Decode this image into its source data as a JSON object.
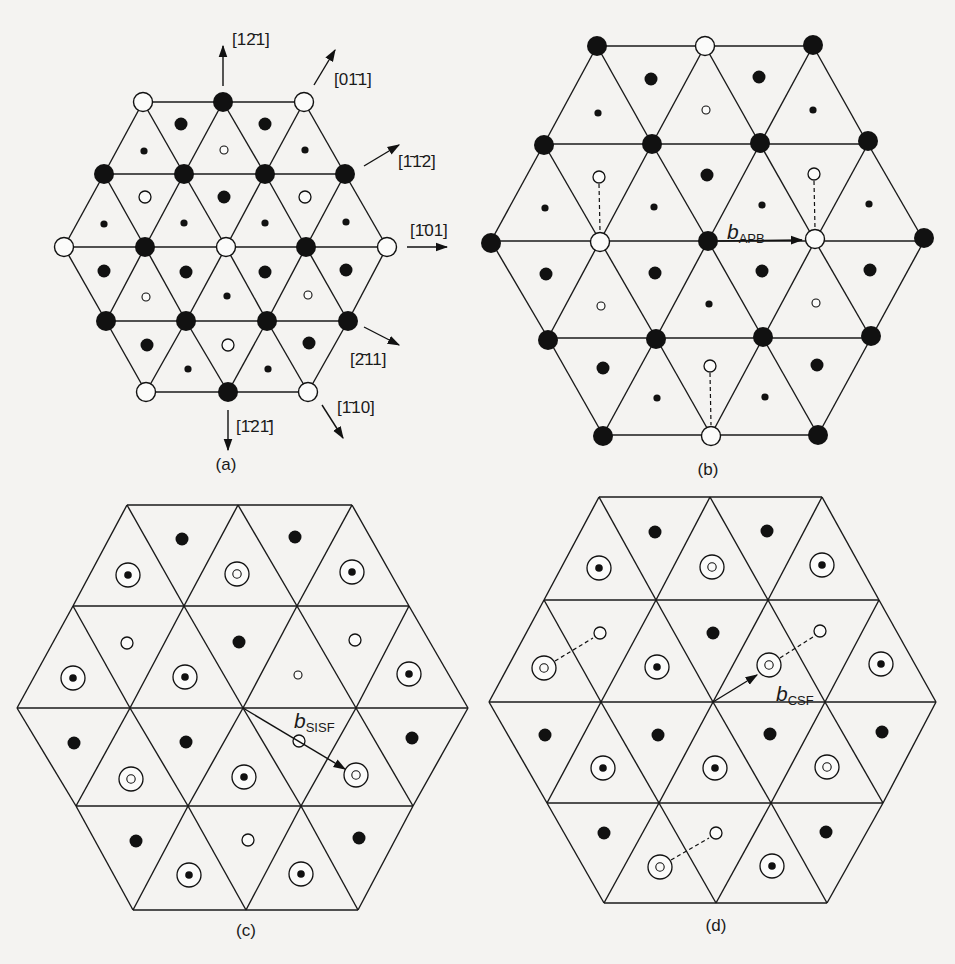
{
  "figure": {
    "legend_glyphs": {
      "lg_filled": "large filled circle (atom in layer A, type 1)",
      "lg_open": "large open circle (atom in layer A, type 2)",
      "md_filled": "medium filled circle (layer B, type 1)",
      "md_open": "medium open circle (layer B, type 2)",
      "sm_filled": "small filled circle (layer C, type 1)",
      "sm_open": "small open circle (layer C, type 2)",
      "target_dot": "ring with filled dot (superposed positions)",
      "target_ring": "ring with open dot (superposed positions)"
    },
    "colors": {
      "ink": "#111111",
      "paper": "#f4f3f1"
    }
  },
  "panels": {
    "a": {
      "caption": "(a)",
      "caption_pos": [
        226,
        470
      ],
      "triangle_rows": [
        {
          "y": 102,
          "x": [
            143,
            223,
            304
          ]
        },
        {
          "y": 174,
          "x": [
            104,
            184,
            265,
            345
          ]
        },
        {
          "y": 247,
          "x": [
            64,
            145,
            226,
            306,
            387
          ]
        },
        {
          "y": 321,
          "x": [
            106,
            186,
            267,
            348
          ]
        },
        {
          "y": 392,
          "x": [
            146,
            228,
            308
          ]
        }
      ],
      "atoms": [
        {
          "x": 143,
          "y": 102,
          "k": "lg_open"
        },
        {
          "x": 223,
          "y": 102,
          "k": "lg_filled"
        },
        {
          "x": 304,
          "y": 102,
          "k": "lg_open"
        },
        {
          "x": 104,
          "y": 174,
          "k": "lg_filled"
        },
        {
          "x": 184,
          "y": 174,
          "k": "lg_filled"
        },
        {
          "x": 265,
          "y": 174,
          "k": "lg_filled"
        },
        {
          "x": 345,
          "y": 174,
          "k": "lg_filled"
        },
        {
          "x": 64,
          "y": 247,
          "k": "lg_open"
        },
        {
          "x": 145,
          "y": 247,
          "k": "lg_filled"
        },
        {
          "x": 226,
          "y": 247,
          "k": "lg_open"
        },
        {
          "x": 306,
          "y": 247,
          "k": "lg_filled"
        },
        {
          "x": 387,
          "y": 247,
          "k": "lg_open"
        },
        {
          "x": 106,
          "y": 321,
          "k": "lg_filled"
        },
        {
          "x": 186,
          "y": 321,
          "k": "lg_filled"
        },
        {
          "x": 267,
          "y": 321,
          "k": "lg_filled"
        },
        {
          "x": 348,
          "y": 321,
          "k": "lg_filled"
        },
        {
          "x": 146,
          "y": 392,
          "k": "lg_open"
        },
        {
          "x": 228,
          "y": 392,
          "k": "lg_filled"
        },
        {
          "x": 308,
          "y": 392,
          "k": "lg_open"
        },
        {
          "x": 181,
          "y": 124,
          "k": "md_filled"
        },
        {
          "x": 265,
          "y": 124,
          "k": "md_filled"
        },
        {
          "x": 144,
          "y": 151,
          "k": "sm_filled"
        },
        {
          "x": 224,
          "y": 150,
          "k": "sm_open"
        },
        {
          "x": 305,
          "y": 150,
          "k": "sm_filled"
        },
        {
          "x": 145,
          "y": 197,
          "k": "md_open"
        },
        {
          "x": 224,
          "y": 197,
          "k": "md_filled"
        },
        {
          "x": 305,
          "y": 197,
          "k": "md_open"
        },
        {
          "x": 104,
          "y": 224,
          "k": "sm_filled"
        },
        {
          "x": 184,
          "y": 223,
          "k": "sm_filled"
        },
        {
          "x": 265,
          "y": 223,
          "k": "sm_filled"
        },
        {
          "x": 346,
          "y": 222,
          "k": "sm_filled"
        },
        {
          "x": 104,
          "y": 271,
          "k": "md_filled"
        },
        {
          "x": 186,
          "y": 272,
          "k": "md_filled"
        },
        {
          "x": 265,
          "y": 272,
          "k": "md_filled"
        },
        {
          "x": 346,
          "y": 270,
          "k": "md_filled"
        },
        {
          "x": 146,
          "y": 297,
          "k": "sm_open"
        },
        {
          "x": 227,
          "y": 296,
          "k": "sm_filled"
        },
        {
          "x": 308,
          "y": 295,
          "k": "sm_open"
        },
        {
          "x": 147,
          "y": 345,
          "k": "md_filled"
        },
        {
          "x": 228,
          "y": 345,
          "k": "md_open"
        },
        {
          "x": 309,
          "y": 343,
          "k": "md_filled"
        },
        {
          "x": 188,
          "y": 369,
          "k": "sm_filled"
        },
        {
          "x": 268,
          "y": 369,
          "k": "sm_filled"
        }
      ],
      "directions": [
        {
          "label": "[1̅2̅1]",
          "text": "[12̄1]",
          "from": [
            223,
            86
          ],
          "to": [
            223,
            46
          ],
          "lx": 232,
          "ly": 45
        },
        {
          "label": "[01̄1]",
          "text": "[01̄1]",
          "from": [
            314,
            85
          ],
          "to": [
            335,
            50
          ],
          "lx": 334,
          "ly": 85
        },
        {
          "label": "[1̄1̄2]",
          "text": "[1̄1̄2]",
          "from": [
            364,
            166
          ],
          "to": [
            399,
            145
          ],
          "lx": 398,
          "ly": 167
        },
        {
          "label": "[1̄01]",
          "text": "[1̄01]",
          "from": [
            407,
            247
          ],
          "to": [
            447,
            247
          ],
          "lx": 410,
          "ly": 236
        },
        {
          "label": "[2̄11]",
          "text": "[2̄11]",
          "from": [
            364,
            327
          ],
          "to": [
            399,
            345
          ],
          "lx": 350,
          "ly": 365
        },
        {
          "label": "[1̄10]",
          "text": "[1̄10]",
          "from": [
            322,
            405
          ],
          "to": [
            343,
            438
          ],
          "lx": 337,
          "ly": 413
        },
        {
          "label": "[1̄21̄]",
          "text": "[1̄21̄]",
          "from": [
            228,
            410
          ],
          "to": [
            228,
            450
          ],
          "lx": 236,
          "ly": 432
        }
      ]
    },
    "b": {
      "caption": "(b)",
      "caption_pos": [
        708,
        475
      ],
      "triangle_rows": [
        {
          "y": 46,
          "x": [
            597,
            705,
            813
          ]
        },
        {
          "y": 144,
          "x": [
            544,
            652,
            760,
            868
          ]
        },
        {
          "y": 241,
          "x": [
            491,
            600,
            708,
            815,
            924
          ]
        },
        {
          "y": 338,
          "x": [
            548,
            656,
            763,
            871
          ]
        },
        {
          "y": 435,
          "x": [
            603,
            711,
            818
          ]
        }
      ],
      "atoms": [
        {
          "x": 597,
          "y": 46,
          "k": "lg_filled"
        },
        {
          "x": 705,
          "y": 46,
          "k": "lg_open"
        },
        {
          "x": 813,
          "y": 45,
          "k": "lg_filled"
        },
        {
          "x": 544,
          "y": 145,
          "k": "lg_filled"
        },
        {
          "x": 652,
          "y": 144,
          "k": "lg_filled"
        },
        {
          "x": 760,
          "y": 143,
          "k": "lg_filled"
        },
        {
          "x": 868,
          "y": 141,
          "k": "lg_filled"
        },
        {
          "x": 491,
          "y": 243,
          "k": "lg_filled"
        },
        {
          "x": 600,
          "y": 242,
          "k": "lg_open"
        },
        {
          "x": 708,
          "y": 241,
          "k": "lg_filled"
        },
        {
          "x": 815,
          "y": 239,
          "k": "lg_open"
        },
        {
          "x": 924,
          "y": 238,
          "k": "lg_filled"
        },
        {
          "x": 548,
          "y": 340,
          "k": "lg_filled"
        },
        {
          "x": 656,
          "y": 339,
          "k": "lg_filled"
        },
        {
          "x": 763,
          "y": 337,
          "k": "lg_filled"
        },
        {
          "x": 871,
          "y": 336,
          "k": "lg_filled"
        },
        {
          "x": 603,
          "y": 436,
          "k": "lg_filled"
        },
        {
          "x": 711,
          "y": 436,
          "k": "lg_open"
        },
        {
          "x": 818,
          "y": 435,
          "k": "lg_filled"
        },
        {
          "x": 651,
          "y": 79,
          "k": "md_filled"
        },
        {
          "x": 759,
          "y": 77,
          "k": "md_filled"
        },
        {
          "x": 598,
          "y": 113,
          "k": "sm_filled"
        },
        {
          "x": 706,
          "y": 110,
          "k": "sm_open"
        },
        {
          "x": 813,
          "y": 110,
          "k": "sm_filled"
        },
        {
          "x": 599,
          "y": 177,
          "k": "md_open"
        },
        {
          "x": 707,
          "y": 175,
          "k": "md_filled"
        },
        {
          "x": 814,
          "y": 174,
          "k": "md_open"
        },
        {
          "x": 545,
          "y": 208,
          "k": "sm_filled"
        },
        {
          "x": 654,
          "y": 207,
          "k": "sm_filled"
        },
        {
          "x": 762,
          "y": 205,
          "k": "sm_filled"
        },
        {
          "x": 869,
          "y": 204,
          "k": "sm_filled"
        },
        {
          "x": 546,
          "y": 274,
          "k": "md_filled"
        },
        {
          "x": 655,
          "y": 273,
          "k": "md_filled"
        },
        {
          "x": 762,
          "y": 271,
          "k": "md_filled"
        },
        {
          "x": 870,
          "y": 270,
          "k": "md_filled"
        },
        {
          "x": 601,
          "y": 306,
          "k": "sm_open"
        },
        {
          "x": 709,
          "y": 304,
          "k": "sm_filled"
        },
        {
          "x": 816,
          "y": 303,
          "k": "sm_open"
        },
        {
          "x": 603,
          "y": 368,
          "k": "md_filled"
        },
        {
          "x": 710,
          "y": 366,
          "k": "md_open"
        },
        {
          "x": 817,
          "y": 365,
          "k": "md_filled"
        },
        {
          "x": 657,
          "y": 398,
          "k": "sm_filled"
        },
        {
          "x": 765,
          "y": 397,
          "k": "sm_filled"
        }
      ],
      "dashed": [
        {
          "from": [
            599,
            184
          ],
          "to": [
            600,
            231
          ]
        },
        {
          "from": [
            814,
            181
          ],
          "to": [
            815,
            229
          ]
        },
        {
          "from": [
            710,
            373
          ],
          "to": [
            711,
            425
          ]
        }
      ],
      "vector": {
        "from": [
          718,
          241
        ],
        "to": [
          802,
          240
        ],
        "symbol": "b",
        "subscript": "APB",
        "lx": 727,
        "ly": 239
      }
    },
    "c": {
      "caption": "(c)",
      "caption_pos": [
        246,
        936
      ],
      "triangle_rows": [
        {
          "y": 505,
          "x": [
            127,
            238,
            352
          ]
        },
        {
          "y": 606,
          "x": [
            73,
            184,
            297,
            409
          ]
        },
        {
          "y": 708,
          "x": [
            17,
            130,
            243,
            356,
            468
          ]
        },
        {
          "y": 806,
          "x": [
            76,
            188,
            301,
            413
          ]
        },
        {
          "y": 910,
          "x": [
            133,
            246,
            358
          ]
        }
      ],
      "atoms": [
        {
          "x": 182,
          "y": 539,
          "k": "md_filled"
        },
        {
          "x": 295,
          "y": 537,
          "k": "md_filled"
        },
        {
          "x": 128,
          "y": 575,
          "k": "target_dot"
        },
        {
          "x": 237,
          "y": 574,
          "k": "target_ring"
        },
        {
          "x": 352,
          "y": 572,
          "k": "target_dot"
        },
        {
          "x": 127,
          "y": 643,
          "k": "md_open"
        },
        {
          "x": 239,
          "y": 642,
          "k": "md_filled"
        },
        {
          "x": 355,
          "y": 640,
          "k": "md_open"
        },
        {
          "x": 73,
          "y": 678,
          "k": "target_dot"
        },
        {
          "x": 185,
          "y": 677,
          "k": "target_dot"
        },
        {
          "x": 298,
          "y": 675,
          "k": "sm_open"
        },
        {
          "x": 409,
          "y": 674,
          "k": "target_dot"
        },
        {
          "x": 74,
          "y": 743,
          "k": "md_filled"
        },
        {
          "x": 186,
          "y": 742,
          "k": "md_filled"
        },
        {
          "x": 299,
          "y": 741,
          "k": "md_open"
        },
        {
          "x": 412,
          "y": 738,
          "k": "md_filled"
        },
        {
          "x": 131,
          "y": 779,
          "k": "target_ring"
        },
        {
          "x": 244,
          "y": 777,
          "k": "target_dot"
        },
        {
          "x": 356,
          "y": 775,
          "k": "target_ring"
        },
        {
          "x": 136,
          "y": 841,
          "k": "md_filled"
        },
        {
          "x": 248,
          "y": 840,
          "k": "md_open"
        },
        {
          "x": 359,
          "y": 838,
          "k": "md_filled"
        },
        {
          "x": 189,
          "y": 875,
          "k": "target_dot"
        },
        {
          "x": 301,
          "y": 874,
          "k": "target_dot"
        }
      ],
      "vector": {
        "from": [
          243,
          708
        ],
        "to": [
          345,
          769
        ],
        "symbol": "b",
        "subscript": "SISF",
        "lx": 294,
        "ly": 728
      }
    },
    "d": {
      "caption": "(d)",
      "caption_pos": [
        716,
        931
      ],
      "triangle_rows": [
        {
          "y": 497,
          "x": [
            599,
            710,
            822
          ]
        },
        {
          "y": 600,
          "x": [
            544,
            656,
            768,
            879
          ]
        },
        {
          "y": 702,
          "x": [
            489,
            601,
            713,
            825,
            936
          ]
        },
        {
          "y": 803,
          "x": [
            547,
            659,
            771,
            883
          ]
        },
        {
          "y": 903,
          "x": [
            604,
            716,
            827
          ]
        }
      ],
      "atoms": [
        {
          "x": 655,
          "y": 532,
          "k": "md_filled"
        },
        {
          "x": 767,
          "y": 531,
          "k": "md_filled"
        },
        {
          "x": 599,
          "y": 568,
          "k": "target_dot"
        },
        {
          "x": 712,
          "y": 567,
          "k": "target_ring"
        },
        {
          "x": 822,
          "y": 565,
          "k": "target_dot"
        },
        {
          "x": 600,
          "y": 633,
          "k": "md_open"
        },
        {
          "x": 713,
          "y": 633,
          "k": "md_filled"
        },
        {
          "x": 820,
          "y": 631,
          "k": "md_open"
        },
        {
          "x": 544,
          "y": 668,
          "k": "target_ring"
        },
        {
          "x": 657,
          "y": 667,
          "k": "target_dot"
        },
        {
          "x": 769,
          "y": 665,
          "k": "target_ring"
        },
        {
          "x": 881,
          "y": 664,
          "k": "target_dot"
        },
        {
          "x": 545,
          "y": 735,
          "k": "md_filled"
        },
        {
          "x": 658,
          "y": 735,
          "k": "md_filled"
        },
        {
          "x": 770,
          "y": 734,
          "k": "md_filled"
        },
        {
          "x": 882,
          "y": 732,
          "k": "md_filled"
        },
        {
          "x": 603,
          "y": 768,
          "k": "target_dot"
        },
        {
          "x": 715,
          "y": 768,
          "k": "target_dot"
        },
        {
          "x": 827,
          "y": 767,
          "k": "target_ring"
        },
        {
          "x": 604,
          "y": 833,
          "k": "md_filled"
        },
        {
          "x": 716,
          "y": 833,
          "k": "md_open"
        },
        {
          "x": 826,
          "y": 832,
          "k": "md_filled"
        },
        {
          "x": 660,
          "y": 867,
          "k": "target_ring"
        },
        {
          "x": 772,
          "y": 866,
          "k": "target_dot"
        }
      ],
      "dashed": [
        {
          "from": [
            555,
            661
          ],
          "to": [
            593,
            638
          ]
        },
        {
          "from": [
            780,
            658
          ],
          "to": [
            813,
            637
          ]
        },
        {
          "from": [
            671,
            860
          ],
          "to": [
            709,
            838
          ]
        }
      ],
      "vector": {
        "from": [
          713,
          702
        ],
        "to": [
          757,
          675
        ],
        "symbol": "b",
        "subscript": "CSF",
        "lx": 776,
        "ly": 701
      }
    }
  }
}
